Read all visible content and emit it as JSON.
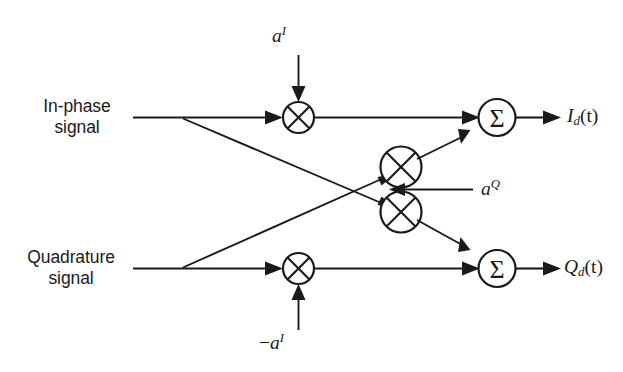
{
  "figure": {
    "type": "block-diagram",
    "title": "",
    "background_color": "#ffffff",
    "line_color": "#1a1a1a",
    "width": 623,
    "height": 372
  },
  "inputs": {
    "in_phase": {
      "label_line1": "In-phase",
      "label_line2": "signal",
      "icon": "signal-input-line"
    },
    "quadrature": {
      "label_line1": "Quadrature",
      "label_line2": "signal"
    }
  },
  "coefficients": {
    "top": {
      "base": "a",
      "superscript": "I",
      "sign": ""
    },
    "middle": {
      "base": "a",
      "superscript": "Q",
      "sign": ""
    },
    "bottom": {
      "base": "a",
      "superscript": "I",
      "sign": "−"
    }
  },
  "nodes": {
    "mixer_top_left": {
      "symbol": "⊗",
      "name": "multiplier"
    },
    "mixer_mid_upper": {
      "symbol": "⊗",
      "name": "multiplier"
    },
    "mixer_mid_lower": {
      "symbol": "⊗",
      "name": "multiplier"
    },
    "mixer_bottom_left": {
      "symbol": "⊗",
      "name": "multiplier"
    },
    "summer_top": {
      "symbol": "Σ",
      "name": "summer"
    },
    "summer_bottom": {
      "symbol": "Σ",
      "name": "summer"
    }
  },
  "outputs": {
    "top": {
      "base": "I",
      "subscript": "d",
      "arg": "(t)"
    },
    "bottom": {
      "base": "Q",
      "subscript": "d",
      "arg": "(t)"
    }
  }
}
